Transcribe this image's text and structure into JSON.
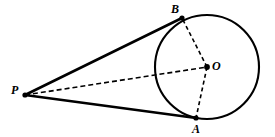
{
  "figure": {
    "type": "geometry-diagram",
    "canvas": {
      "width": 275,
      "height": 137
    },
    "stroke_color": "#000000",
    "background_color": "#ffffff",
    "circle": {
      "name": "circle-O",
      "center": {
        "x": 207,
        "y": 67
      },
      "radius": 52,
      "stroke_width": 2.1,
      "style": "solid"
    },
    "points": [
      {
        "id": "P",
        "label": "P",
        "x": 25,
        "y": 95,
        "dot_radius": 2.6,
        "label_position": "left"
      },
      {
        "id": "B",
        "label": "B",
        "x": 182,
        "y": 18,
        "dot_radius": 2.6,
        "label_position": "above-left"
      },
      {
        "id": "O",
        "label": "O",
        "x": 207,
        "y": 67,
        "dot_radius": 2.9,
        "label_position": "right"
      },
      {
        "id": "A",
        "label": "A",
        "x": 196,
        "y": 118,
        "dot_radius": 2.6,
        "label_position": "below"
      }
    ],
    "segments": [
      {
        "id": "PB",
        "from": "P",
        "to": "B",
        "style": "solid",
        "stroke_width": 2.6,
        "role": "tangent"
      },
      {
        "id": "PA",
        "from": "P",
        "to": "A",
        "style": "solid",
        "stroke_width": 2.6,
        "role": "tangent"
      },
      {
        "id": "PO",
        "from": "P",
        "to": "O",
        "style": "dashed",
        "stroke_width": 1.6,
        "role": "construction",
        "dash_pattern": "5,3"
      },
      {
        "id": "OB",
        "from": "O",
        "to": "B",
        "style": "dashed",
        "stroke_width": 1.6,
        "role": "radius",
        "dash_pattern": "4,3"
      },
      {
        "id": "OA",
        "from": "O",
        "to": "A",
        "style": "dashed",
        "stroke_width": 1.6,
        "role": "radius",
        "dash_pattern": "4,3"
      }
    ]
  }
}
